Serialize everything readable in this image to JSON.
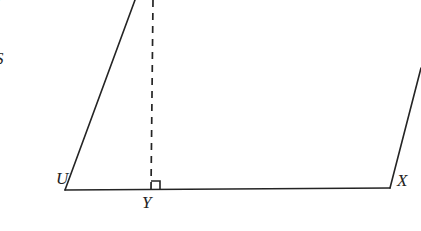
{
  "figure": {
    "kind": "geometry-diagram",
    "background_color": "#ffffff",
    "stroke_color": "#242424",
    "stroke_width": 1.6,
    "width": 421,
    "height": 231
  },
  "labels": {
    "u": "U",
    "x": "X",
    "y": "Y",
    "s_clipped": "S",
    "top_clipped": "V"
  },
  "points": {
    "u": {
      "x": 65,
      "y": 190
    },
    "x": {
      "x": 390,
      "y": 188
    },
    "y": {
      "x": 151,
      "y": 190
    },
    "apex_top_exit": {
      "x": 135,
      "y": 0
    },
    "dashed_top_exit": {
      "x": 153,
      "y": 0
    },
    "right_ray_exit": {
      "x": 421,
      "y": 68
    }
  },
  "segments": [
    {
      "name": "base-UX",
      "from": "u",
      "to": "x",
      "style": "solid"
    },
    {
      "name": "left-side-U-up",
      "from": "u",
      "to": "apex_top_exit",
      "style": "solid"
    },
    {
      "name": "right-side-X-up",
      "from": "x",
      "to": "right_ray_exit",
      "style": "solid"
    },
    {
      "name": "altitude-to-Y",
      "from": "dashed_top_exit",
      "to": "y",
      "style": "dashed"
    }
  ],
  "right_angle_marker": {
    "name": "right-angle-at-Y",
    "vertex": {
      "x": 151,
      "y": 190
    },
    "size": 9,
    "side": "right"
  }
}
